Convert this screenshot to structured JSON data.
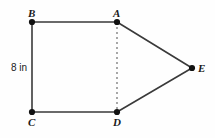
{
  "figure": {
    "type": "geometry-diagram",
    "shape": "pentagon",
    "background_color": "#fefefe",
    "stroke_color": "#3a3a3a",
    "dash_color": "#6e6e6e",
    "vertex_color": "#111111",
    "text_color": "#1a1a1a",
    "vertices": [
      {
        "id": "B",
        "label": "B",
        "x": 32,
        "y": 22,
        "label_x": 28,
        "label_y": 8
      },
      {
        "id": "A",
        "label": "A",
        "x": 117,
        "y": 22,
        "label_x": 113,
        "label_y": 8
      },
      {
        "id": "E",
        "label": "E",
        "x": 192,
        "y": 68,
        "label_x": 198,
        "label_y": 63
      },
      {
        "id": "D",
        "label": "D",
        "x": 117,
        "y": 112,
        "label_x": 113,
        "label_y": 117
      },
      {
        "id": "C",
        "label": "C",
        "x": 32,
        "y": 112,
        "label_x": 28,
        "label_y": 117
      }
    ],
    "edges": [
      {
        "from": "B",
        "to": "A",
        "style": "solid"
      },
      {
        "from": "A",
        "to": "E",
        "style": "solid"
      },
      {
        "from": "E",
        "to": "D",
        "style": "solid"
      },
      {
        "from": "D",
        "to": "C",
        "style": "solid"
      },
      {
        "from": "C",
        "to": "B",
        "style": "solid"
      },
      {
        "from": "A",
        "to": "D",
        "style": "dashed"
      }
    ],
    "measurements": [
      {
        "id": "bc",
        "edge": "C-B",
        "text": "8 in",
        "label_x": 11,
        "label_y": 63
      }
    ]
  }
}
